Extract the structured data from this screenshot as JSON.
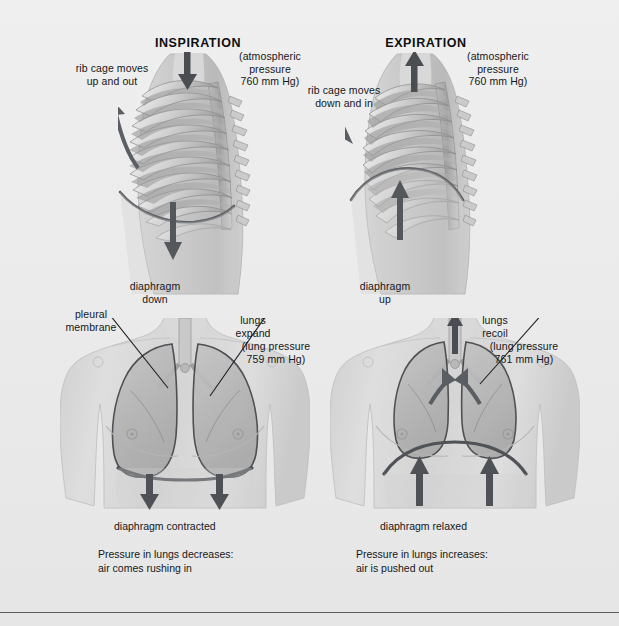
{
  "figure": {
    "title_left": "INSPIRATION",
    "title_right": "EXPIRATION",
    "style": "grayscale anatomical illustration",
    "background_color": "#eaeaea",
    "ink_color": "#15171a"
  },
  "left_panel": {
    "heading": "INSPIRATION",
    "ribcage_label": "rib cage moves\nup and out",
    "atmospheric_label": "(atmospheric\npressure\n760 mm Hg)",
    "diaphragm_label": "diaphragm\ndown",
    "pleural_label": "pleural\nmembrane",
    "lungs_label": "lungs\nexpand",
    "lung_pressure_label": "(lung pressure\n759 mm Hg)",
    "diaphragm_state": "diaphragm contracted",
    "summary": "Pressure in lungs decreases:\nair comes rushing in",
    "arrows": {
      "ribcage": "up-left",
      "airflow": "down-into-trachea",
      "diaphragm": "down",
      "lower_diaphragm": "down-down"
    }
  },
  "right_panel": {
    "heading": "EXPIRATION",
    "ribcage_label": "rib cage moves\ndown and in",
    "atmospheric_label": "(atmospheric\npressure\n760 mm Hg)",
    "diaphragm_label": "diaphragm\nup",
    "lungs_label": "lungs\nrecoil",
    "lung_pressure_label": "(lung pressure\n761 mm Hg)",
    "diaphragm_state": "diaphragm relaxed",
    "summary": "Pressure in lungs increases:\nair is pushed out",
    "arrows": {
      "ribcage": "down-right",
      "airflow": "up-out-of-trachea",
      "diaphragm": "up",
      "lower_diaphragm": "up-up"
    }
  },
  "values": {
    "atmospheric_pressure_mmhg": 760,
    "lung_pressure_inspiration_mmhg": 759,
    "lung_pressure_expiration_mmhg": 761
  }
}
